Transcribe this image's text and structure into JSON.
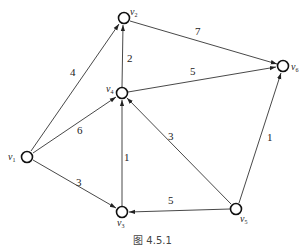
{
  "diagram": {
    "type": "weighted-directed-graph",
    "caption": "图 4.5.1",
    "nodes": [
      {
        "id": "v1",
        "label": "v",
        "sub": "1",
        "x": 27,
        "y": 157
      },
      {
        "id": "v2",
        "label": "v",
        "sub": "2",
        "x": 124,
        "y": 18
      },
      {
        "id": "v3",
        "label": "v",
        "sub": "3",
        "x": 122,
        "y": 212
      },
      {
        "id": "v4",
        "label": "v",
        "sub": "4",
        "x": 122,
        "y": 93
      },
      {
        "id": "v5",
        "label": "v",
        "sub": "5",
        "x": 236,
        "y": 209
      },
      {
        "id": "v6",
        "label": "v",
        "sub": "6",
        "x": 283,
        "y": 66
      }
    ],
    "edges": [
      {
        "from": "v1",
        "to": "v2",
        "weight": "4"
      },
      {
        "from": "v1",
        "to": "v4",
        "weight": "6"
      },
      {
        "from": "v1",
        "to": "v3",
        "weight": "3"
      },
      {
        "from": "v4",
        "to": "v2",
        "weight": "2"
      },
      {
        "from": "v2",
        "to": "v6",
        "weight": "7"
      },
      {
        "from": "v4",
        "to": "v6",
        "weight": "5"
      },
      {
        "from": "v3",
        "to": "v4",
        "weight": "1"
      },
      {
        "from": "v5",
        "to": "v4",
        "weight": "3"
      },
      {
        "from": "v5",
        "to": "v3",
        "weight": "5"
      },
      {
        "from": "v5",
        "to": "v6",
        "weight": "1"
      }
    ]
  }
}
